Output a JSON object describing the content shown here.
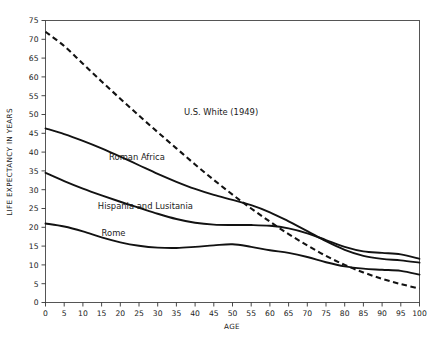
{
  "chart_data": {
    "type": "line",
    "title": "",
    "xlabel": "AGE",
    "ylabel": "LIFE EXPECTANCY IN YEARS",
    "xlim": [
      0,
      100
    ],
    "ylim": [
      0,
      75
    ],
    "xticks": [
      0,
      5,
      10,
      15,
      20,
      25,
      30,
      35,
      40,
      45,
      50,
      55,
      60,
      65,
      70,
      75,
      80,
      85,
      90,
      95,
      100
    ],
    "yticks": [
      0,
      5,
      10,
      15,
      20,
      25,
      30,
      35,
      40,
      45,
      50,
      55,
      60,
      65,
      70,
      75
    ],
    "grid": false,
    "legend": "inline-labels",
    "x": [
      0,
      5,
      10,
      15,
      20,
      25,
      30,
      35,
      40,
      45,
      50,
      55,
      60,
      65,
      70,
      75,
      80,
      85,
      90,
      95,
      100
    ],
    "series": [
      {
        "name": "U.S. White (1949)",
        "style": "dashed",
        "color": "#121212",
        "label_position": {
          "x": 37,
          "y": 50
        },
        "values": [
          72.0,
          68.2,
          63.5,
          58.8,
          54.2,
          49.7,
          45.3,
          41.0,
          36.7,
          32.6,
          28.7,
          25.0,
          21.5,
          18.2,
          15.2,
          12.4,
          10.0,
          8.0,
          6.3,
          4.9,
          3.7
        ]
      },
      {
        "name": "Roman Africa",
        "style": "solid",
        "color": "#121212",
        "label_position": {
          "x": 17,
          "y": 38
        },
        "values": [
          46.3,
          44.8,
          43.0,
          41.0,
          38.8,
          36.5,
          34.2,
          32.1,
          30.2,
          28.6,
          27.3,
          25.9,
          24.0,
          21.6,
          19.0,
          16.3,
          14.0,
          12.4,
          11.6,
          11.2,
          10.6
        ]
      },
      {
        "name": "Hispania and Lusitania",
        "style": "solid",
        "color": "#121212",
        "label_position": {
          "x": 14,
          "y": 25
        },
        "values": [
          34.5,
          32.3,
          30.3,
          28.5,
          26.8,
          25.2,
          23.6,
          22.2,
          21.2,
          20.7,
          20.6,
          20.6,
          20.4,
          19.7,
          18.4,
          16.6,
          14.8,
          13.6,
          13.2,
          12.8,
          11.6
        ]
      },
      {
        "name": "Rome",
        "style": "solid",
        "color": "#121212",
        "label_position": {
          "x": 15,
          "y": 17.6
        },
        "values": [
          21.0,
          20.2,
          18.9,
          17.3,
          16.0,
          15.1,
          14.6,
          14.5,
          14.8,
          15.2,
          15.5,
          14.8,
          13.9,
          13.2,
          12.1,
          10.7,
          9.6,
          9.0,
          8.7,
          8.4,
          7.4
        ]
      }
    ]
  }
}
